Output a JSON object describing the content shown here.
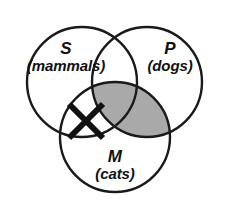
{
  "figure": {
    "type": "venn-diagram",
    "name": "three-circle-venn-diagram",
    "background_color": "#ffffff",
    "stroke_color": "#1a1a1a",
    "stroke_width": 2.4,
    "shaded_color": "#a9a9a9",
    "width": 229,
    "height": 219
  },
  "sets": [
    {
      "id": "S",
      "letter": "S",
      "subtitle": "(mammals)",
      "center_x": 82,
      "center_y": 82,
      "radius": 55
    },
    {
      "id": "P",
      "letter": "P",
      "subtitle": "(dogs)",
      "center_x": 147,
      "center_y": 82,
      "radius": 55
    },
    {
      "id": "M",
      "letter": "M",
      "subtitle": "(cats)",
      "center_x": 115,
      "center_y": 137,
      "radius": 55
    }
  ],
  "regions": {
    "shaded": {
      "name": "p-intersect-m-shaded-region",
      "description": "P and M overlap shaded gray",
      "fill": "#a9a9a9"
    },
    "marked": {
      "name": "x-mark-region",
      "description": "X placed in S and M overlap outside P",
      "symbol": "X",
      "center_x": 86,
      "center_y": 121,
      "arm": 17,
      "stroke_width": 6
    }
  }
}
